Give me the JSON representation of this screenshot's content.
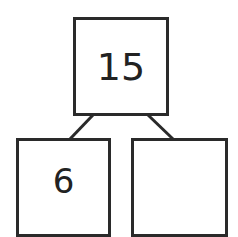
{
  "diagram": {
    "type": "number-bond",
    "whole": {
      "value": "15"
    },
    "parts": [
      {
        "value": "6"
      },
      {
        "value": ""
      }
    ]
  }
}
